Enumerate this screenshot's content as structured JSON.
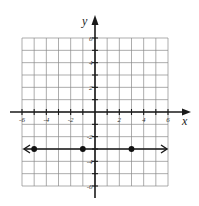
{
  "chart_data": {
    "type": "line",
    "title": "",
    "xlabel": "x",
    "ylabel": "y",
    "xlim": [
      -6,
      6
    ],
    "ylim": [
      -6,
      6
    ],
    "grid": true,
    "x_ticks": [
      -6,
      -5,
      -4,
      -3,
      -2,
      -1,
      1,
      2,
      3,
      4,
      5,
      6
    ],
    "x_tick_labels": [
      {
        "value": -6,
        "label": "-6"
      },
      {
        "value": -4,
        "label": "-4"
      },
      {
        "value": -2,
        "label": "-2"
      },
      {
        "value": 2,
        "label": "2"
      },
      {
        "value": 4,
        "label": "4"
      },
      {
        "value": 6,
        "label": "6"
      }
    ],
    "y_ticks": [
      -6,
      -5,
      -4,
      -3,
      -2,
      -1,
      1,
      2,
      3,
      4,
      5,
      6
    ],
    "y_tick_labels": [
      {
        "value": 6,
        "label": "6"
      },
      {
        "value": 4,
        "label": "4"
      },
      {
        "value": 2,
        "label": "2"
      },
      {
        "value": -2,
        "label": "-2"
      },
      {
        "value": -4,
        "label": "-4"
      },
      {
        "value": -6,
        "label": "-6"
      }
    ],
    "series": [
      {
        "name": "y = -3",
        "kind": "horizontal-line-with-arrows",
        "y": -3,
        "x_range": [
          -6,
          6
        ],
        "points": [
          {
            "x": -5,
            "y": -3
          },
          {
            "x": -1,
            "y": -3
          },
          {
            "x": 3,
            "y": -3
          }
        ]
      }
    ]
  }
}
